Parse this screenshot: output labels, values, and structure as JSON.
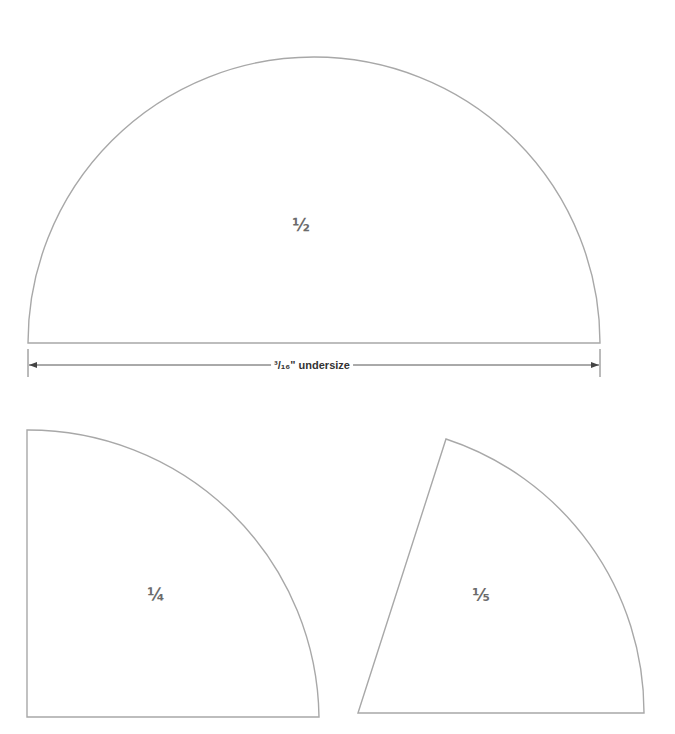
{
  "diagram": {
    "shapes": [
      {
        "id": "half",
        "label": "½",
        "type": "semicircle"
      },
      {
        "id": "quarter",
        "label": "¼",
        "type": "quarter-circle"
      },
      {
        "id": "fifth",
        "label": "⅕",
        "type": "circle-sector"
      }
    ],
    "dimension": {
      "label": "³/₁₆\" undersize"
    },
    "colors": {
      "outline": "#a8a8a8",
      "label": "#6b6b6b",
      "dimension_line": "#555555"
    }
  }
}
